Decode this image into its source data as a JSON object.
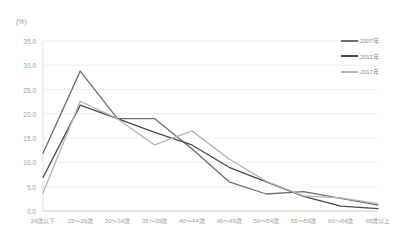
{
  "chart_data": {
    "type": "line",
    "title": "",
    "xlabel": "",
    "ylabel": "(%)",
    "unit_label": "(%)",
    "ylim": [
      0.0,
      35.0
    ],
    "ytick_step": 5.0,
    "grid": true,
    "legend_position": "top-right",
    "categories": [
      "24歳以下",
      "25～29歳",
      "30～34歳",
      "35～39歳",
      "40～44歳",
      "45～49歳",
      "50～54歳",
      "55～59歳",
      "60～64歳",
      "65歳以上"
    ],
    "ytick_labels": [
      "0.0",
      "5.0",
      "10.0",
      "15.0",
      "20.0",
      "25.0",
      "30.0",
      "35.0"
    ],
    "ytick_values": [
      0.0,
      5.0,
      10.0,
      15.0,
      20.0,
      25.0,
      30.0,
      35.0
    ],
    "series": [
      {
        "name": "2007年",
        "color": "#6f6f6f",
        "values": [
          11.9,
          28.8,
          19.0,
          19.0,
          12.8,
          6.0,
          3.5,
          4.0,
          2.6,
          1.2
        ]
      },
      {
        "name": "2012年",
        "color": "#4a4a4a",
        "values": [
          6.9,
          21.8,
          19.0,
          16.2,
          13.6,
          9.0,
          6.0,
          3.0,
          1.0,
          0.5
        ]
      },
      {
        "name": "2017年",
        "color": "#b4b4b4",
        "values": [
          3.7,
          22.6,
          19.0,
          13.6,
          16.5,
          10.7,
          6.1,
          3.1,
          2.7,
          1.5
        ]
      }
    ]
  },
  "legend": {
    "items": [
      {
        "label": "2007年",
        "color": "#6f6f6f"
      },
      {
        "label": "2012年",
        "color": "#4a4a4a"
      },
      {
        "label": "2017年",
        "color": "#b4b4b4"
      }
    ]
  },
  "colors": {
    "background": "#ffffff",
    "grid": "#e9e9e9",
    "axis": "#d8d8d8",
    "tick_text": "#a2a2a2"
  }
}
